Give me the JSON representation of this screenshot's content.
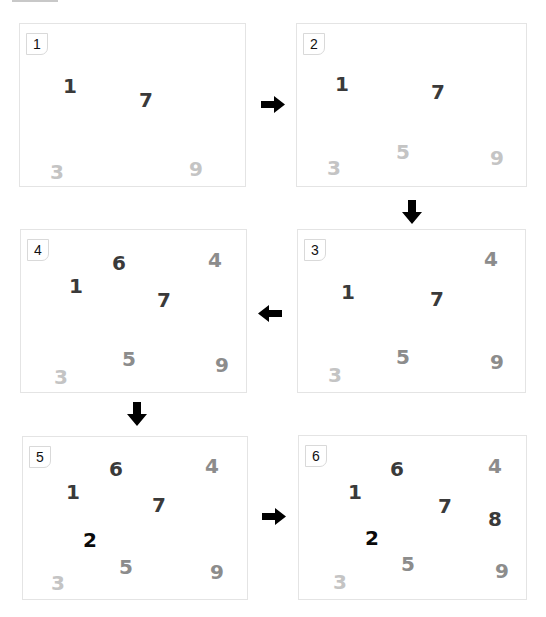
{
  "colors": {
    "black": "#0a0a0a",
    "dark": "#3a3a3a",
    "mid": "#8c8c8c",
    "light": "#c4c4c4",
    "panel_border": "#e4e4e4",
    "arrow": "#000000"
  },
  "panels": [
    {
      "label": "1",
      "x": 19,
      "y": 23,
      "w": 227,
      "h": 164,
      "digits": [
        {
          "text": "1",
          "x": 43,
          "y": 52,
          "tone": "dark"
        },
        {
          "text": "7",
          "x": 119,
          "y": 66,
          "tone": "dark"
        },
        {
          "text": "3",
          "x": 30,
          "y": 138,
          "tone": "light"
        },
        {
          "text": "9",
          "x": 169,
          "y": 135,
          "tone": "light"
        }
      ]
    },
    {
      "label": "2",
      "x": 296,
      "y": 23,
      "w": 231,
      "h": 164,
      "digits": [
        {
          "text": "1",
          "x": 38,
          "y": 50,
          "tone": "dark"
        },
        {
          "text": "7",
          "x": 134,
          "y": 58,
          "tone": "dark"
        },
        {
          "text": "5",
          "x": 99,
          "y": 118,
          "tone": "light"
        },
        {
          "text": "3",
          "x": 30,
          "y": 134,
          "tone": "light"
        },
        {
          "text": "9",
          "x": 193,
          "y": 124,
          "tone": "light"
        }
      ]
    },
    {
      "label": "3",
      "x": 297,
      "y": 229,
      "w": 229,
      "h": 164,
      "digits": [
        {
          "text": "4",
          "x": 186,
          "y": 19,
          "tone": "mid"
        },
        {
          "text": "1",
          "x": 43,
          "y": 52,
          "tone": "dark"
        },
        {
          "text": "7",
          "x": 132,
          "y": 59,
          "tone": "dark"
        },
        {
          "text": "5",
          "x": 98,
          "y": 117,
          "tone": "mid"
        },
        {
          "text": "3",
          "x": 30,
          "y": 135,
          "tone": "light"
        },
        {
          "text": "9",
          "x": 192,
          "y": 122,
          "tone": "mid"
        }
      ]
    },
    {
      "label": "4",
      "x": 20,
      "y": 229,
      "w": 227,
      "h": 164,
      "digits": [
        {
          "text": "6",
          "x": 91,
          "y": 23,
          "tone": "dark"
        },
        {
          "text": "4",
          "x": 187,
          "y": 20,
          "tone": "mid"
        },
        {
          "text": "1",
          "x": 48,
          "y": 46,
          "tone": "dark"
        },
        {
          "text": "7",
          "x": 136,
          "y": 60,
          "tone": "dark"
        },
        {
          "text": "5",
          "x": 101,
          "y": 119,
          "tone": "mid"
        },
        {
          "text": "3",
          "x": 33,
          "y": 137,
          "tone": "light"
        },
        {
          "text": "9",
          "x": 194,
          "y": 125,
          "tone": "mid"
        }
      ]
    },
    {
      "label": "5",
      "x": 22,
      "y": 436,
      "w": 226,
      "h": 164,
      "digits": [
        {
          "text": "6",
          "x": 86,
          "y": 22,
          "tone": "dark"
        },
        {
          "text": "4",
          "x": 182,
          "y": 19,
          "tone": "mid"
        },
        {
          "text": "1",
          "x": 43,
          "y": 45,
          "tone": "dark"
        },
        {
          "text": "7",
          "x": 129,
          "y": 58,
          "tone": "dark"
        },
        {
          "text": "2",
          "x": 60,
          "y": 93,
          "tone": "black"
        },
        {
          "text": "5",
          "x": 96,
          "y": 120,
          "tone": "mid"
        },
        {
          "text": "3",
          "x": 28,
          "y": 136,
          "tone": "light"
        },
        {
          "text": "9",
          "x": 187,
          "y": 125,
          "tone": "mid"
        }
      ]
    },
    {
      "label": "6",
      "x": 298,
      "y": 435,
      "w": 229,
      "h": 165,
      "digits": [
        {
          "text": "6",
          "x": 91,
          "y": 23,
          "tone": "dark"
        },
        {
          "text": "4",
          "x": 189,
          "y": 20,
          "tone": "mid"
        },
        {
          "text": "1",
          "x": 49,
          "y": 46,
          "tone": "dark"
        },
        {
          "text": "7",
          "x": 139,
          "y": 60,
          "tone": "dark"
        },
        {
          "text": "8",
          "x": 189,
          "y": 73,
          "tone": "dark"
        },
        {
          "text": "2",
          "x": 66,
          "y": 92,
          "tone": "black"
        },
        {
          "text": "5",
          "x": 102,
          "y": 118,
          "tone": "mid"
        },
        {
          "text": "3",
          "x": 34,
          "y": 136,
          "tone": "light"
        },
        {
          "text": "9",
          "x": 196,
          "y": 125,
          "tone": "mid"
        }
      ]
    }
  ],
  "arrows": [
    {
      "direction": "right",
      "x": 261,
      "y": 96,
      "w": 24,
      "h": 17
    },
    {
      "direction": "down",
      "x": 402,
      "y": 200,
      "w": 20,
      "h": 24
    },
    {
      "direction": "left",
      "x": 258,
      "y": 305,
      "w": 24,
      "h": 17
    },
    {
      "direction": "down",
      "x": 127,
      "y": 402,
      "w": 20,
      "h": 24
    },
    {
      "direction": "right",
      "x": 262,
      "y": 508,
      "w": 24,
      "h": 17
    }
  ]
}
